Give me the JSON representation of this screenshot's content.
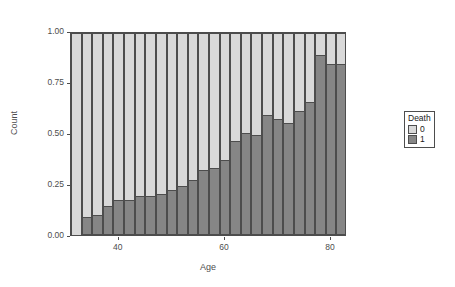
{
  "chart_data": {
    "type": "bar",
    "subtype": "stacked-proportional",
    "title": "",
    "xlabel": "Age",
    "ylabel": "Count",
    "xlim": [
      31,
      83
    ],
    "ylim": [
      0.0,
      1.0
    ],
    "grid": false,
    "legend": {
      "title": "Death",
      "position": "right",
      "entries": [
        {
          "label": "0",
          "color": "#d9d9d9"
        },
        {
          "label": "1",
          "color": "#868686"
        }
      ]
    },
    "y_ticks": [
      "0.00",
      "0.25",
      "0.50",
      "0.75",
      "1.00"
    ],
    "y_tick_values": [
      0.0,
      0.25,
      0.5,
      0.75,
      1.0
    ],
    "x_ticks": [
      "40",
      "60",
      "80"
    ],
    "x_tick_values": [
      40,
      60,
      80
    ],
    "categories": [
      32,
      34,
      36,
      38,
      40,
      42,
      44,
      46,
      48,
      50,
      52,
      54,
      56,
      58,
      60,
      62,
      64,
      66,
      68,
      70,
      72,
      74,
      76,
      78,
      80,
      82
    ],
    "series": [
      {
        "name": "1",
        "color": "#868686",
        "values": [
          0.0,
          0.09,
          0.1,
          0.14,
          0.17,
          0.17,
          0.19,
          0.19,
          0.2,
          0.22,
          0.24,
          0.27,
          0.32,
          0.33,
          0.37,
          0.46,
          0.5,
          0.49,
          0.59,
          0.57,
          0.55,
          0.61,
          0.65,
          0.88,
          0.84,
          0.84
        ]
      },
      {
        "name": "0",
        "color": "#d9d9d9",
        "values": [
          1.0,
          0.91,
          0.9,
          0.86,
          0.83,
          0.83,
          0.81,
          0.81,
          0.8,
          0.78,
          0.76,
          0.73,
          0.68,
          0.67,
          0.63,
          0.54,
          0.5,
          0.51,
          0.41,
          0.43,
          0.45,
          0.39,
          0.35,
          0.12,
          0.16,
          0.16
        ]
      }
    ]
  }
}
